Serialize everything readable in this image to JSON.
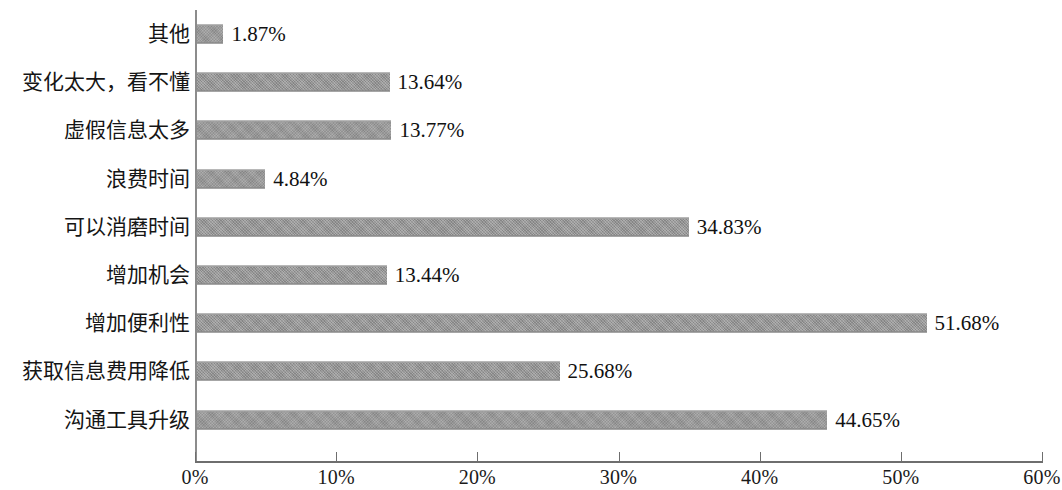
{
  "chart_data": {
    "type": "bar",
    "orientation": "horizontal",
    "title": "",
    "subtitle": "",
    "xlabel": "",
    "ylabel": "",
    "xlim": [
      0,
      60
    ],
    "grid": false,
    "legend": null,
    "value_suffix": "%",
    "xticks": [
      "0%",
      "10%",
      "20%",
      "30%",
      "40%",
      "50%",
      "60%"
    ],
    "xtick_values": [
      0,
      10,
      20,
      30,
      40,
      50,
      60
    ],
    "categories": [
      "其他",
      "变化太大，看不懂",
      "虚假信息太多",
      "浪费时间",
      "可以消磨时间",
      "增加机会",
      "增加便利性",
      "获取信息费用降低",
      "沟通工具升级"
    ],
    "values": [
      1.87,
      13.64,
      13.77,
      4.84,
      34.83,
      13.44,
      51.68,
      25.68,
      44.65
    ],
    "value_labels": [
      "1.87%",
      "13.64%",
      "13.77%",
      "4.84%",
      "34.83%",
      "13.44%",
      "51.68%",
      "25.68%",
      "44.65%"
    ],
    "bar_color": "#939393",
    "axis_color": "#6e6e6e",
    "background_color": "#ffffff"
  }
}
